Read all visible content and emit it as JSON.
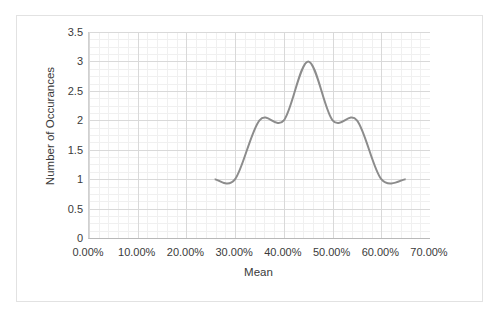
{
  "chart_data": {
    "type": "line",
    "title": "",
    "xlabel": "Mean",
    "ylabel": "Number of Occurances",
    "xlim": [
      0,
      70
    ],
    "ylim": [
      0,
      3.5
    ],
    "grid": true,
    "legend": false,
    "smoothed": true,
    "line_color": "#8c8c8c",
    "x_tick_labels": [
      "0.00%",
      "10.00%",
      "20.00%",
      "30.00%",
      "40.00%",
      "50.00%",
      "60.00%",
      "70.00%"
    ],
    "x_tick_values": [
      0,
      10,
      20,
      30,
      40,
      50,
      60,
      70
    ],
    "y_tick_labels": [
      "0",
      "0.5",
      "1",
      "1.5",
      "2",
      "2.5",
      "3",
      "3.5"
    ],
    "y_tick_values": [
      0,
      0.5,
      1,
      1.5,
      2,
      2.5,
      3,
      3.5
    ],
    "x": [
      25.8,
      30.0,
      35.0,
      40.0,
      45.0,
      50.0,
      55.0,
      60.0,
      65.0
    ],
    "values": [
      1,
      1,
      2,
      2,
      3,
      2,
      2,
      1,
      1
    ],
    "series": [
      {
        "name": "Occurances",
        "x": [
          25.8,
          30.0,
          35.0,
          40.0,
          45.0,
          50.0,
          55.0,
          60.0,
          65.0
        ],
        "values": [
          1,
          1,
          2,
          2,
          3,
          2,
          2,
          1,
          1
        ]
      }
    ]
  },
  "colors": {
    "line": "#8c8c8c",
    "major_grid": "#d9d9d9",
    "minor_grid": "#f0f0f0",
    "axis": "#bfbfbf",
    "text": "#3a3a3a",
    "frame": "#e2e2e2",
    "background": "#ffffff"
  }
}
